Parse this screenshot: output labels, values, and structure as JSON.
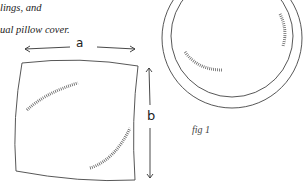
{
  "text": {
    "line1": "lings, and",
    "line2": "ual pillow cover."
  },
  "figure": {
    "label": "fig 1",
    "square_cover": {
      "width_label": "a",
      "height_label": "b"
    },
    "round_cover": {
      "shape": "circle with piping border"
    }
  },
  "colors": {
    "stroke": "#333333",
    "background": "#ffffff"
  }
}
